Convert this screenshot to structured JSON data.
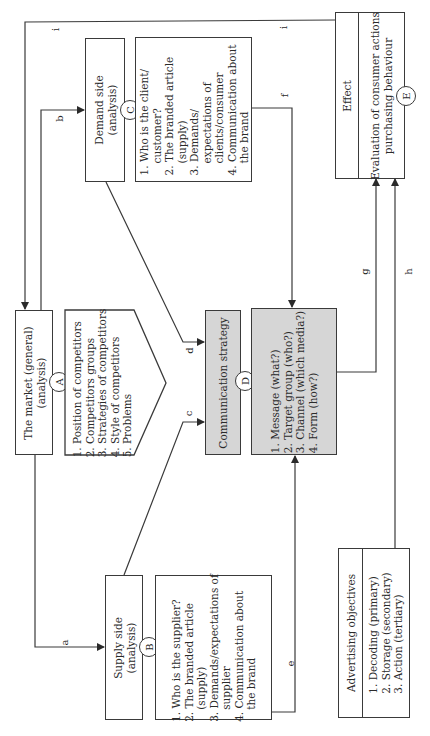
{
  "diagram": {
    "orientation": "rotated 90 degrees counter-clockwise",
    "nodes": {
      "market": {
        "id": "A",
        "title": "The market (general)",
        "subtitle": "(analysis)",
        "items": [
          "1. Position of competitors",
          "2. Competitors groups",
          "3. Strategies of competitors",
          "4. Style of competitors",
          "5. Problems"
        ]
      },
      "supply": {
        "id": "B",
        "title": "Supply side",
        "subtitle": "(analysis)",
        "items": [
          "1. Who is the supplier?",
          "2. The branded article",
          "(supply)",
          "3. Demands/expectations of",
          "supplier",
          "4. Communication about",
          "the brand"
        ]
      },
      "demand": {
        "id": "C",
        "title": "Demand side",
        "subtitle": "(analysis)",
        "items": [
          "1. Who is the client/",
          "customer?",
          "2. The branded article",
          "(supply)",
          "3. Demands/",
          "expectations of",
          "clients/consumer",
          "4. Communication about",
          "the brand"
        ]
      },
      "strategy": {
        "id": "D",
        "title": "Communication strategy",
        "items": [
          "1. Message (what?)",
          "2. Target group (who?)",
          "3. Channel (which media?)",
          "4. Form (how?)"
        ]
      },
      "effect": {
        "id": "E",
        "title": "Effect",
        "items": [
          "Evaluation of consumer actions",
          "purchasing behaviour"
        ]
      },
      "objectives": {
        "title": "Advertising objectives",
        "items": [
          "1. Decoding (primary)",
          "2. Storage (secondary)",
          "3. Action (tertiary)"
        ]
      }
    },
    "edges": {
      "a": "a",
      "b": "b",
      "c": "c",
      "d": "d",
      "e": "e",
      "f": "f",
      "g": "g",
      "h": "h",
      "i1": "i",
      "i2": "i"
    },
    "colors": {
      "line": "#3a3a3a",
      "shaded_fill": "#d6d6d6",
      "background": "#ffffff"
    }
  }
}
